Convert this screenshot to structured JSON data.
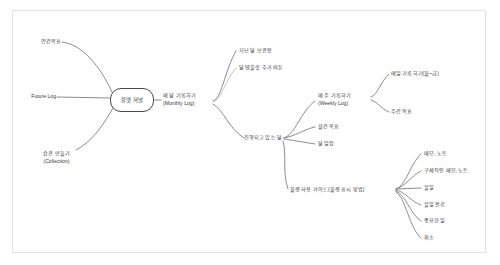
{
  "diagram": {
    "type": "mind-map",
    "title_node": "불렛 저널",
    "background": "#ffffff",
    "frame_color": "#e2e2e2",
    "edge_color": "#6f6f72",
    "edge_color_light": "#b9b9bd",
    "text_color": "#3a3a3c"
  },
  "root": {
    "label": "불렛 저널",
    "x": 131,
    "y": 100
  },
  "nodes": {
    "yearly_goal": {
      "label": "연간목표",
      "x": 33,
      "y": 43,
      "anchor": "left"
    },
    "future_log": {
      "label": "Future Log",
      "x": 22,
      "y": 97,
      "anchor": "left"
    },
    "collection": {
      "label": "습관 만들기",
      "label2": "(Collection)",
      "x": 22,
      "y": 158,
      "anchor": "left"
    },
    "monthly_log": {
      "label": "매 달 기록하기",
      "label2": "(Monthly Log)",
      "x": 163,
      "y": 96,
      "anchor": "left"
    },
    "last_month_archive": {
      "label": "지난 달 보관함",
      "x": 239,
      "y": 51,
      "anchor": "left"
    },
    "month_template_button": {
      "label": "달 템플릿 추가 버튼",
      "x": 239,
      "y": 68,
      "anchor": "left"
    },
    "current_month": {
      "label": "진행되고 있는 달",
      "x": 241,
      "y": 138,
      "anchor": "right"
    },
    "weekly_log": {
      "label": "매 주 기록하기",
      "label2": "(Weekly Log)",
      "x": 318,
      "y": 96,
      "anchor": "left"
    },
    "daily_log": {
      "label": "매일 기록하기(월~금)",
      "x": 391,
      "y": 74,
      "anchor": "left"
    },
    "weekly_goal": {
      "label": "주간 목표",
      "x": 391,
      "y": 112,
      "anchor": "left"
    },
    "monthly_goal": {
      "label": "월간 목표",
      "x": 318,
      "y": 127,
      "anchor": "left"
    },
    "month_schedule": {
      "label": "달 일정",
      "x": 318,
      "y": 144,
      "anchor": "left"
    },
    "bullet_guide": {
      "label": "불렛 사용 가이드(불렛 표시 방법)",
      "x": 290,
      "y": 190,
      "anchor": "left"
    },
    "memo_note": {
      "label": "메모, 노트",
      "x": 424,
      "y": 154,
      "anchor": "left"
    },
    "specific_memo_note": {
      "label": "구체적인 메모, 노트",
      "x": 424,
      "y": 171,
      "anchor": "left"
    },
    "todo": {
      "label": "할일",
      "x": 424,
      "y": 188,
      "anchor": "left"
    },
    "todo_done": {
      "label": "할일 완료",
      "x": 424,
      "y": 205,
      "anchor": "left"
    },
    "important": {
      "label": "중요한 일",
      "x": 424,
      "y": 221,
      "anchor": "left"
    },
    "cancel": {
      "label": "취소",
      "x": 424,
      "y": 238,
      "anchor": "left"
    }
  }
}
